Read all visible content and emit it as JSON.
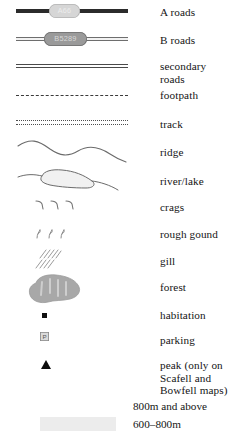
{
  "legend": {
    "title": "Map legend",
    "items": [
      {
        "key": "a-roads",
        "symbol": "a-road-line",
        "label": "A roads",
        "badge_text": "A66"
      },
      {
        "key": "b-roads",
        "symbol": "b-road-line",
        "label": "B roads",
        "badge_text": "B5289"
      },
      {
        "key": "secondary-roads",
        "symbol": "double-line",
        "label": "secondary roads"
      },
      {
        "key": "footpath",
        "symbol": "dashed-line",
        "label": "footpath"
      },
      {
        "key": "track",
        "symbol": "double-dotted-line",
        "label": "track"
      },
      {
        "key": "ridge",
        "symbol": "wavy-ridge-line",
        "label": "ridge"
      },
      {
        "key": "river-lake",
        "symbol": "river-lake-outline",
        "label": "river/lake"
      },
      {
        "key": "crags",
        "symbol": "crag-ticks",
        "label": "crags"
      },
      {
        "key": "rough-ground",
        "symbol": "rough-ground-marks",
        "label": "rough gound"
      },
      {
        "key": "gill",
        "symbol": "gill-hatching",
        "label": "gill"
      },
      {
        "key": "forest",
        "symbol": "forest-blob",
        "label": "forest"
      },
      {
        "key": "habitation",
        "symbol": "filled-square",
        "label": "habitation"
      },
      {
        "key": "parking",
        "symbol": "parking-box",
        "label": "parking",
        "badge_text": "P"
      },
      {
        "key": "peak",
        "symbol": "filled-triangle",
        "label": "peak (only on Scafell and Bowfell maps)"
      }
    ],
    "elevation": [
      {
        "key": "elev-800",
        "label": "800m and above",
        "color": "#ffffff"
      },
      {
        "key": "elev-600",
        "label": "600–800m",
        "color": "#ececec"
      }
    ]
  },
  "colors": {
    "a_road": "#2b2b2b",
    "b_road_badge": "#9a9a9a",
    "a_road_badge": "#d6d6d6",
    "line_gray": "#6e6e6e",
    "ink": "#141414",
    "forest": "#a8a8a8",
    "swatch_600": "#ececec",
    "swatch_800": "#ffffff"
  }
}
